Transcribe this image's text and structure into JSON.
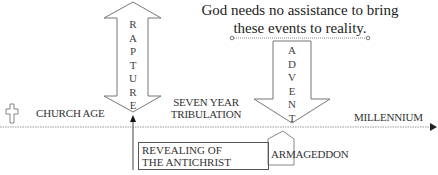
{
  "quote": {
    "line1": "God needs no assistance to bring",
    "line2": "these events to reality."
  },
  "rapture": {
    "letters": [
      "R",
      "A",
      "P",
      "T",
      "U",
      "R",
      "E"
    ],
    "direction": "up-and-down"
  },
  "advent": {
    "letters": [
      "A",
      "D",
      "V",
      "E",
      "N",
      "T"
    ],
    "direction": "down"
  },
  "timeline": {
    "periods": [
      {
        "label": "CHURCH AGE"
      },
      {
        "label_line1": "SEVEN YEAR",
        "label_line2": "TRIBULATION"
      },
      {
        "label": "MILLENNIUM"
      }
    ]
  },
  "events": {
    "antichrist_line1": "REVEALING OF",
    "antichrist_line2": "THE ANTICHRIST",
    "armageddon": "ARMAGEDDON"
  },
  "icons": {
    "cross": "cross-icon",
    "timeline_arrow": "arrow-right-icon"
  },
  "colors": {
    "stroke": "#666666",
    "text": "#333333",
    "background": "#ffffff"
  }
}
